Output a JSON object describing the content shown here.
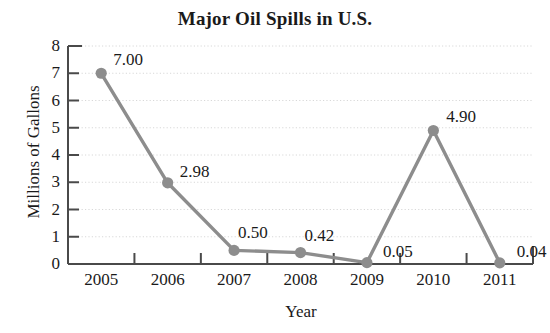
{
  "chart_data": {
    "type": "line",
    "title": "Major Oil Spills in U.S.",
    "xlabel": "Year",
    "ylabel": "Millions of Gallons",
    "categories": [
      "2005",
      "2006",
      "2007",
      "2008",
      "2009",
      "2010",
      "2011"
    ],
    "values": [
      7.0,
      2.98,
      0.5,
      0.42,
      0.05,
      4.9,
      0.04
    ],
    "point_labels": [
      "7.00",
      "2.98",
      "0.50",
      "0.42",
      "0.05",
      "4.90",
      "0.04"
    ],
    "ylim": [
      0,
      8
    ],
    "ytick_labels": [
      "8",
      "7",
      "6",
      "5",
      "4",
      "3",
      "2",
      "1",
      "0"
    ],
    "ytick_values": [
      8,
      7,
      6,
      5,
      4,
      3,
      2,
      1,
      0
    ],
    "grid": true,
    "legend": false,
    "series_color": "#8d8d8d",
    "marker_color": "#8d8d8d",
    "grid_color": "#d8d8d8",
    "axis_color": "#4a4a4a"
  }
}
